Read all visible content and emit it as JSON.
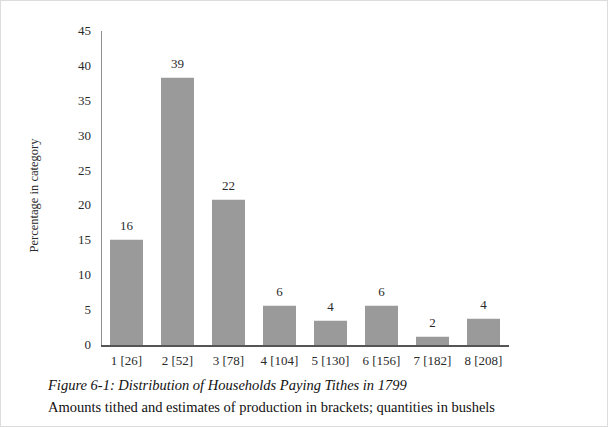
{
  "figure": {
    "caption_title": "Figure 6-1: Distribution of Households Paying Tithes in 1799",
    "caption_subtitle": "Amounts tithed and estimates of production in brackets; quantities in bushels"
  },
  "chart_data": {
    "type": "bar",
    "title": "Figure 6-1: Distribution of Households Paying Tithes in 1799",
    "subtitle": "Amounts tithed and estimates of production in brackets; quantities in bushels",
    "xlabel": "",
    "ylabel": "Percentage in category",
    "categories": [
      "1 [26]",
      "2 [52]",
      "3 [78]",
      "4 [104]",
      "5 [130]",
      "6 [156]",
      "7 [182]",
      "8 [208]"
    ],
    "values": [
      15.0,
      38.2,
      20.8,
      5.6,
      3.4,
      5.6,
      1.2,
      3.7
    ],
    "point_labels": [
      "16",
      "39",
      "22",
      "6",
      "4",
      "6",
      "2",
      "4"
    ],
    "point_label_meaning": "number of households in category",
    "ylim": [
      0,
      45
    ],
    "yticks": [
      0,
      5,
      10,
      15,
      20,
      25,
      30,
      35,
      40,
      45
    ],
    "ytick_labels": [
      "0",
      "5",
      "10",
      "15",
      "20",
      "25",
      "30",
      "35",
      "40",
      "45"
    ],
    "grid": false,
    "legend": false,
    "bar_color": "#9a9a9a",
    "axis_color": "#555555",
    "background": "#ffffff"
  }
}
